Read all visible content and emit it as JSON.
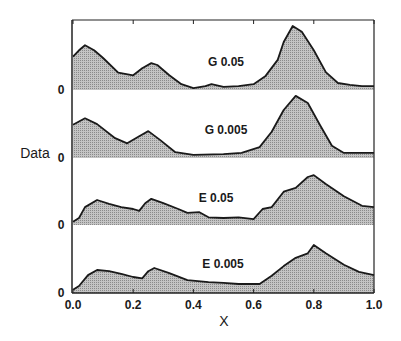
{
  "chart_data": {
    "type": "area",
    "title": "",
    "xlabel": "X",
    "ylabel": "Data",
    "xlim": [
      0.0,
      1.0
    ],
    "x_ticks": [
      "0.0",
      "0.2",
      "0.4",
      "0.6",
      "0.8",
      "1.0"
    ],
    "y_ticks_per_panel": [
      "0"
    ],
    "grid": false,
    "legend": "none (panels labeled inline)",
    "layout": "4 vertically stacked filled-area panels sharing x axis; values are relative heights (0-1 scale per panel)",
    "series": [
      {
        "name": "G 0.05",
        "x": [
          0.0,
          0.02,
          0.04,
          0.07,
          0.1,
          0.15,
          0.2,
          0.23,
          0.26,
          0.28,
          0.32,
          0.36,
          0.4,
          0.44,
          0.46,
          0.5,
          0.55,
          0.6,
          0.64,
          0.68,
          0.7,
          0.73,
          0.76,
          0.8,
          0.84,
          0.88,
          0.92,
          0.96,
          1.0
        ],
        "values": [
          0.52,
          0.62,
          0.7,
          0.62,
          0.5,
          0.27,
          0.23,
          0.34,
          0.42,
          0.39,
          0.23,
          0.09,
          0.03,
          0.06,
          0.09,
          0.05,
          0.06,
          0.09,
          0.22,
          0.47,
          0.75,
          1.0,
          0.91,
          0.62,
          0.28,
          0.11,
          0.08,
          0.06,
          0.06
        ]
      },
      {
        "name": "G 0.005",
        "x": [
          0.0,
          0.04,
          0.08,
          0.14,
          0.18,
          0.22,
          0.25,
          0.29,
          0.34,
          0.4,
          0.5,
          0.56,
          0.62,
          0.66,
          0.7,
          0.74,
          0.78,
          0.82,
          0.86,
          0.9,
          1.0
        ],
        "values": [
          0.52,
          0.62,
          0.53,
          0.31,
          0.23,
          0.34,
          0.42,
          0.28,
          0.09,
          0.05,
          0.06,
          0.08,
          0.17,
          0.41,
          0.75,
          0.97,
          0.86,
          0.52,
          0.19,
          0.08,
          0.08
        ]
      },
      {
        "name": "E 0.05",
        "x": [
          0.0,
          0.02,
          0.04,
          0.08,
          0.12,
          0.16,
          0.2,
          0.22,
          0.24,
          0.26,
          0.3,
          0.35,
          0.38,
          0.42,
          0.45,
          0.5,
          0.55,
          0.6,
          0.63,
          0.66,
          0.7,
          0.74,
          0.78,
          0.8,
          0.84,
          0.9,
          0.96,
          1.0
        ],
        "values": [
          0.05,
          0.11,
          0.28,
          0.39,
          0.33,
          0.28,
          0.25,
          0.22,
          0.34,
          0.41,
          0.34,
          0.25,
          0.19,
          0.2,
          0.12,
          0.11,
          0.12,
          0.09,
          0.25,
          0.28,
          0.52,
          0.58,
          0.75,
          0.78,
          0.64,
          0.45,
          0.3,
          0.28
        ]
      },
      {
        "name": "E 0.005",
        "x": [
          0.0,
          0.02,
          0.05,
          0.08,
          0.12,
          0.16,
          0.2,
          0.23,
          0.25,
          0.27,
          0.32,
          0.38,
          0.45,
          0.5,
          0.55,
          0.62,
          0.66,
          0.7,
          0.74,
          0.78,
          0.8,
          0.84,
          0.9,
          0.95,
          1.0
        ],
        "values": [
          0.05,
          0.11,
          0.28,
          0.36,
          0.34,
          0.3,
          0.25,
          0.23,
          0.34,
          0.39,
          0.31,
          0.2,
          0.17,
          0.16,
          0.14,
          0.14,
          0.27,
          0.42,
          0.55,
          0.62,
          0.75,
          0.62,
          0.44,
          0.33,
          0.28
        ]
      }
    ]
  },
  "labels": {
    "ylabel": "Data",
    "xlabel": "X",
    "zero": "0"
  },
  "colors": {
    "fill": "#b8b8b8",
    "stroke": "#1a1a1a",
    "axis": "#222222",
    "background": "#ffffff"
  }
}
